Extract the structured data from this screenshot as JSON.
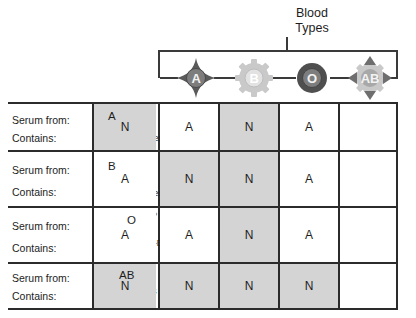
{
  "header": {
    "title": "Blood\nTypes",
    "blood_types": [
      {
        "label": "A",
        "icon": "star-diamond-icon",
        "tone": "dark",
        "color": "#5a5a5a"
      },
      {
        "label": "B",
        "icon": "gear-cog-icon",
        "tone": "light",
        "color": "#c9c9c9"
      },
      {
        "label": "O",
        "icon": "ring-circle-icon",
        "tone": "dark",
        "color": "#4f4f4f"
      },
      {
        "label": "AB",
        "icon": "gear-arrows-icon",
        "tone": "mixed",
        "color": "#8c8c8c"
      }
    ]
  },
  "table": {
    "row_label_serum": "Serum from:",
    "row_label_contains": "Contains:",
    "rows": [
      {
        "type": "A",
        "antibody_text": "Anti-B Antibodies",
        "antibodies": [
          {
            "name": "antibody-y-icon",
            "color": "#8fa3b8"
          }
        ],
        "results": [
          {
            "value": "N",
            "shaded": true
          },
          {
            "value": "A",
            "shaded": false
          },
          {
            "value": "N",
            "shaded": true
          },
          {
            "value": "A",
            "shaded": false
          }
        ]
      },
      {
        "type": "B",
        "antibody_text": "Anti-A Antibodies",
        "antibodies": [
          {
            "name": "antibody-y-icon",
            "color": "#b8b8b8"
          }
        ],
        "results": [
          {
            "value": "A",
            "shaded": false
          },
          {
            "value": "N",
            "shaded": true
          },
          {
            "value": "N",
            "shaded": true
          },
          {
            "value": "A",
            "shaded": false
          }
        ]
      },
      {
        "type": "O",
        "antibody_text": "Anti-A and Anti-B\nAntibodies",
        "antibodies": [
          {
            "name": "antibody-y-icon",
            "color": "#b8b8b8"
          },
          {
            "name": "antibody-y-icon",
            "color": "#8fa3b8"
          }
        ],
        "results": [
          {
            "value": "A",
            "shaded": false
          },
          {
            "value": "A",
            "shaded": false
          },
          {
            "value": "N",
            "shaded": true
          },
          {
            "value": "A",
            "shaded": false
          }
        ]
      },
      {
        "type": "AB",
        "antibody_text": "No Antibodies\nto A or B",
        "antibodies": [],
        "results": [
          {
            "value": "N",
            "shaded": true
          },
          {
            "value": "N",
            "shaded": true
          },
          {
            "value": "N",
            "shaded": true
          },
          {
            "value": "N",
            "shaded": true
          }
        ]
      }
    ]
  },
  "colors": {
    "line": "#2b2b2b",
    "shaded_cell": "#d4d4d4",
    "plain_cell": "#ffffff",
    "text": "#1d1d1d"
  }
}
